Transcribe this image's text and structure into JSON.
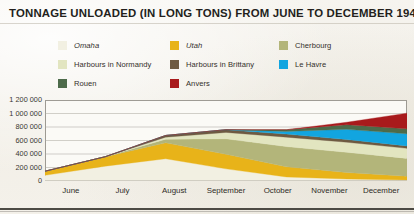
{
  "chart_data": {
    "type": "area",
    "stacked": true,
    "title": "TONNAGE UNLOADED (IN LONG TONS) FROM JUNE TO DECEMBER 1944",
    "xlabel": "",
    "ylabel": "",
    "categories": [
      "June",
      "July",
      "August",
      "September",
      "October",
      "November",
      "December"
    ],
    "ylim": [
      0,
      1200000
    ],
    "yticks": [
      0,
      200000,
      400000,
      600000,
      800000,
      1000000,
      1200000
    ],
    "ytick_labels": [
      "0",
      "200 000",
      "400 000",
      "600 000",
      "800 000",
      "1 000 000",
      "1 200 000"
    ],
    "grid": true,
    "legend_position": "top",
    "series": [
      {
        "name": "Omaha",
        "color": "#f2f0e2",
        "values": [
          85000,
          220000,
          330000,
          180000,
          60000,
          30000,
          15000
        ]
      },
      {
        "name": "Utah",
        "color": "#e8b319",
        "values": [
          60000,
          140000,
          235000,
          215000,
          150000,
          95000,
          55000
        ]
      },
      {
        "name": "Cherbourg",
        "color": "#b3b57a",
        "values": [
          0,
          0,
          55000,
          230000,
          300000,
          300000,
          265000
        ]
      },
      {
        "name": "Harbours in Normandy",
        "color": "#e2e5c0",
        "values": [
          0,
          0,
          30000,
          95000,
          140000,
          150000,
          150000
        ]
      },
      {
        "name": "Harbours in Brittany",
        "color": "#6e5a41",
        "values": [
          0,
          0,
          25000,
          40000,
          45000,
          40000,
          35000
        ]
      },
      {
        "name": "Le Havre",
        "color": "#12a5e0",
        "values": [
          0,
          0,
          0,
          0,
          40000,
          150000,
          180000
        ]
      },
      {
        "name": "Rouen",
        "color": "#4d6b4a",
        "values": [
          0,
          0,
          0,
          0,
          25000,
          70000,
          75000
        ]
      },
      {
        "name": "Anvers",
        "color": "#a81a1c",
        "values": [
          0,
          0,
          0,
          0,
          0,
          35000,
          230000
        ]
      }
    ]
  },
  "legend": {
    "items": [
      {
        "label": "Omaha",
        "color": "#f2f0e2",
        "italic": true,
        "col": 0,
        "row": 0
      },
      {
        "label": "Harbours in Normandy",
        "color": "#e2e5c0",
        "italic": false,
        "col": 0,
        "row": 1
      },
      {
        "label": "Rouen",
        "color": "#4d6b4a",
        "italic": false,
        "col": 0,
        "row": 2
      },
      {
        "label": "Utah",
        "color": "#e8b319",
        "italic": true,
        "col": 1,
        "row": 0
      },
      {
        "label": "Harbours in Brittany",
        "color": "#6e5a41",
        "italic": false,
        "col": 1,
        "row": 1
      },
      {
        "label": "Anvers",
        "color": "#a81a1c",
        "italic": false,
        "col": 1,
        "row": 2
      },
      {
        "label": "Cherbourg",
        "color": "#b3b57a",
        "italic": false,
        "col": 2,
        "row": 0
      },
      {
        "label": "Le Havre",
        "color": "#12a5e0",
        "italic": false,
        "col": 2,
        "row": 1
      }
    ]
  },
  "colors": {
    "background": "#f4f2ec",
    "plot_background": "#fbfaf6",
    "axis": "#9d9a93",
    "grid": "#a9a69d",
    "text": "#231f1c",
    "rule": "#3b3833"
  }
}
